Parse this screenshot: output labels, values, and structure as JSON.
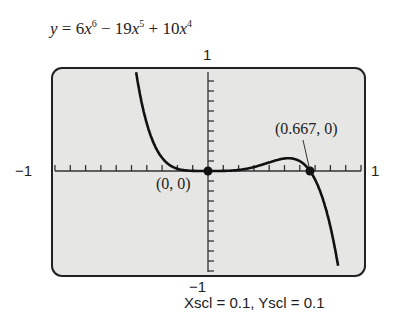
{
  "chart_data": {
    "type": "line",
    "xlabel": "",
    "ylabel": "",
    "xlim": [
      -1,
      1
    ],
    "ylim": [
      -1,
      1
    ],
    "grid": false,
    "xscl": 0.1,
    "yscl": 0.1,
    "series": [
      {
        "name": "y = 6x^6 - 19x^5 + 10x^4",
        "x": [
          -0.47,
          -0.4,
          -0.3,
          -0.2,
          -0.1,
          0,
          0.1,
          0.2,
          0.3,
          0.4,
          0.5,
          0.6,
          0.667,
          0.7,
          0.8,
          0.85
        ],
        "y": [
          0.988,
          0.475,
          0.13,
          0.023,
          0.001,
          0,
          0.001,
          0.011,
          0.04,
          0.086,
          0.125,
          0.087,
          0,
          -0.066,
          -0.69,
          -1.0
        ]
      }
    ],
    "points": [
      {
        "label": "(0, 0)",
        "x": 0,
        "y": 0
      },
      {
        "label": "(0.667, 0)",
        "x": 0.667,
        "y": 0
      }
    ],
    "tick_labels": {
      "x_min": "−1",
      "x_max": "1",
      "y_min": "−1",
      "y_max": "1"
    }
  },
  "labels": {
    "title_parts": {
      "y": "y",
      "eq": " = 6",
      "x1": "x",
      "p1": "6",
      "m": " − 19",
      "x2": "x",
      "p2": "5",
      "pl": " + 10",
      "x3": "x",
      "p3": "4"
    },
    "x_min": "−1",
    "x_max": "1",
    "y_max": "1",
    "y_min": "−1",
    "origin": "(0, 0)",
    "root": "(0.667, 0)",
    "scale": "Xscl = 0.1, Yscl = 0.1"
  }
}
